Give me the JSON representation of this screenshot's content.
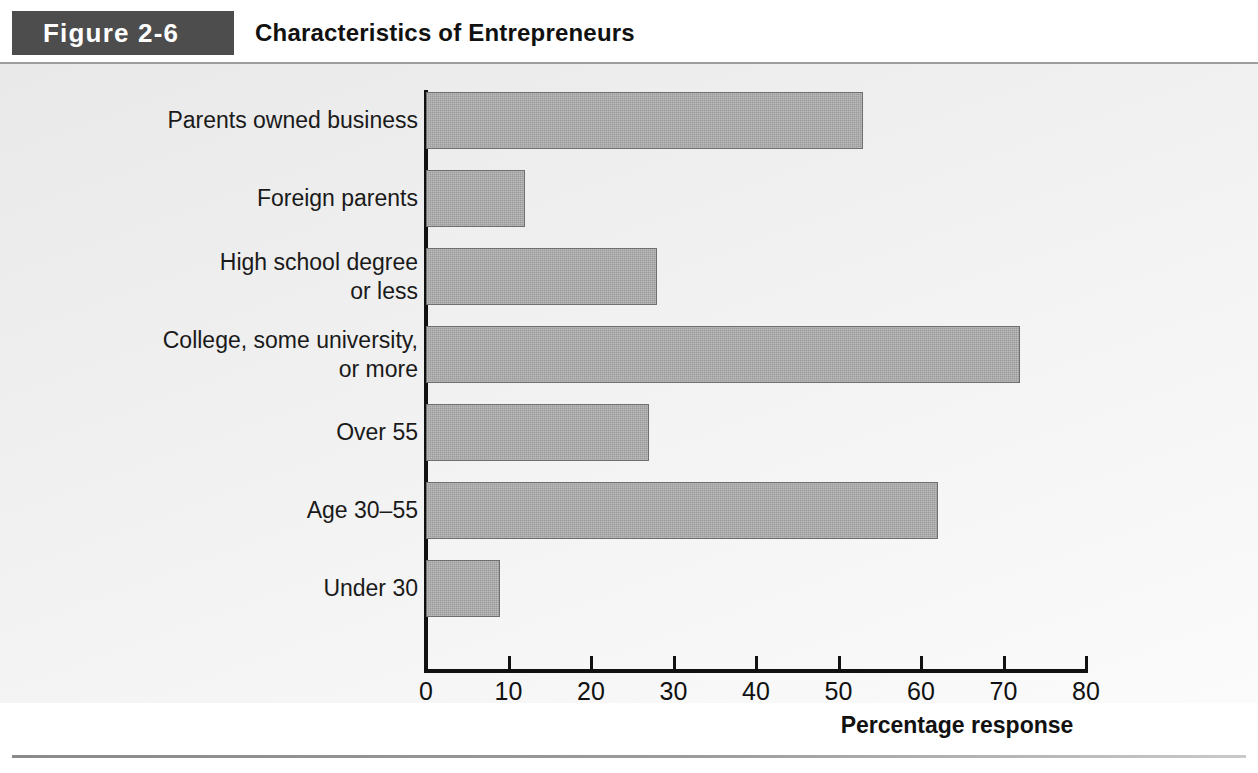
{
  "figure": {
    "number_label": "Figure 2-6",
    "title": "Characteristics of Entrepreneurs"
  },
  "chart_data": {
    "type": "bar",
    "orientation": "horizontal",
    "title": "Characteristics of Entrepreneurs",
    "xlabel": "Percentage response",
    "ylabel": "",
    "xlim": [
      0,
      80
    ],
    "xticks": [
      "0",
      "10",
      "20",
      "30",
      "40",
      "50",
      "60",
      "70",
      "80"
    ],
    "grid": false,
    "legend": "none",
    "bar_color": "#9c9c9c",
    "bar_border_color": "#6f6f6f",
    "categories": [
      "Parents owned business",
      "Foreign parents",
      "High school degree\nor less",
      "College, some university,\nor more",
      "Over 55",
      "Age 30–55",
      "Under 30"
    ],
    "values": [
      53,
      12,
      28,
      72,
      27,
      62,
      9
    ]
  }
}
